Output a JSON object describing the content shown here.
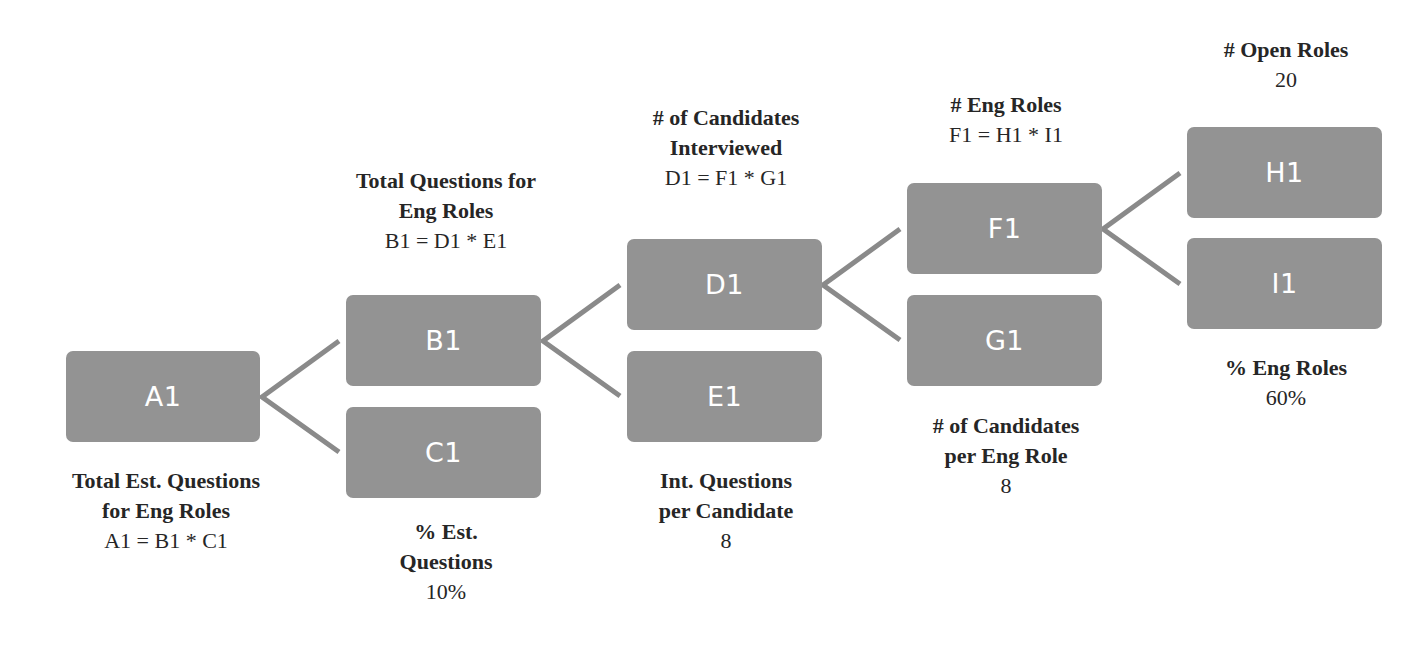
{
  "diagram": {
    "type": "driver-tree",
    "colors": {
      "node_fill": "#939393",
      "node_text": "#ffffff",
      "connector": "#8a8a8a",
      "label_text": "#262626"
    },
    "nodes": {
      "A1": {
        "id": "A1",
        "title_line1": "Total Est. Questions",
        "title_line2": "for Eng Roles",
        "value": "A1 = B1 * C1"
      },
      "B1": {
        "id": "B1",
        "title_line1": "Total Questions for",
        "title_line2": "Eng Roles",
        "value": "B1 = D1 * E1"
      },
      "C1": {
        "id": "C1",
        "title_line1": "% Est.",
        "title_line2": "Questions",
        "value": "10%"
      },
      "D1": {
        "id": "D1",
        "title_line1": "# of Candidates",
        "title_line2": "Interviewed",
        "value": "D1 = F1 * G1"
      },
      "E1": {
        "id": "E1",
        "title_line1": "Int. Questions",
        "title_line2": "per Candidate",
        "value": "8"
      },
      "F1": {
        "id": "F1",
        "title_line1": "# Eng Roles",
        "value": "F1 = H1 * I1"
      },
      "G1": {
        "id": "G1",
        "title_line1": "# of Candidates",
        "title_line2": "per Eng Role",
        "value": "8"
      },
      "H1": {
        "id": "H1",
        "title_line1": "# Open Roles",
        "value": "20"
      },
      "I1": {
        "id": "I1",
        "title_line1": "% Eng Roles",
        "value": "60%"
      }
    },
    "edges": [
      [
        "A1",
        "B1"
      ],
      [
        "A1",
        "C1"
      ],
      [
        "B1",
        "D1"
      ],
      [
        "B1",
        "E1"
      ],
      [
        "D1",
        "F1"
      ],
      [
        "D1",
        "G1"
      ],
      [
        "F1",
        "H1"
      ],
      [
        "F1",
        "I1"
      ]
    ]
  }
}
